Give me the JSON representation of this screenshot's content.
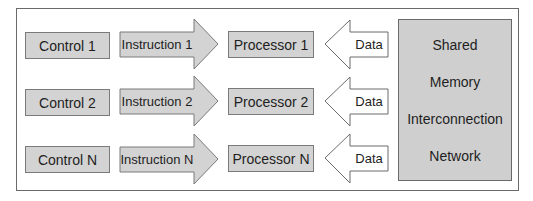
{
  "diagram": {
    "rows": [
      {
        "control": "Control 1",
        "instruction": "Instruction 1",
        "processor": "Processor 1",
        "data": "Data"
      },
      {
        "control": "Control 2",
        "instruction": "Instruction 2",
        "processor": "Processor 2",
        "data": "Data"
      },
      {
        "control": "Control N",
        "instruction": "Instruction N",
        "processor": "Processor N",
        "data": "Data"
      }
    ],
    "shared_memory": {
      "lines": [
        "Shared",
        "Memory",
        "Interconnection",
        "Network"
      ]
    },
    "colors": {
      "box_fill": "#d3d3d3",
      "border": "#6a6a6a",
      "data_arrow_fill": "#ffffff"
    }
  }
}
